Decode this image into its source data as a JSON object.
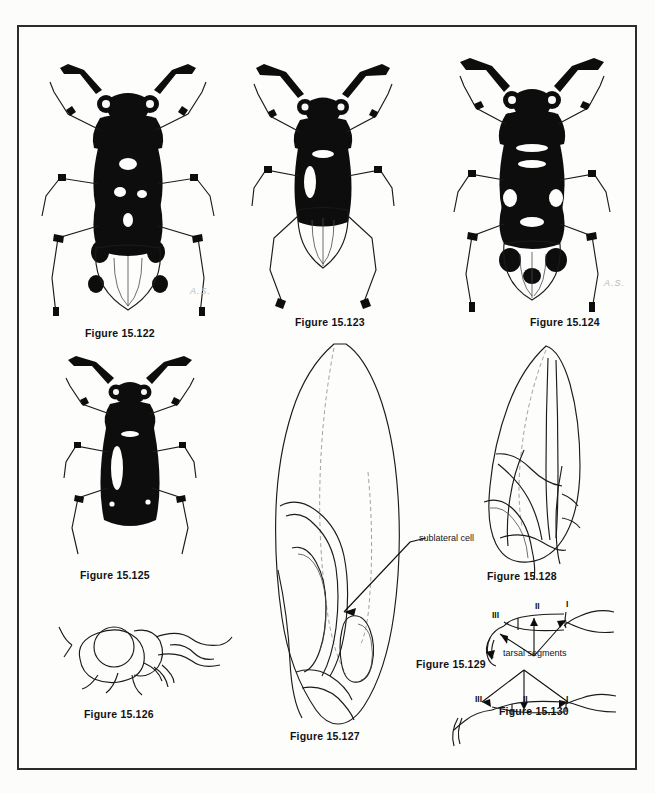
{
  "plate": {
    "kind": "scanned-figure-plate",
    "subject": "Heteroptera (true bugs) — habitus, hemelytra venation, head and tarsal segments",
    "border_color": "#2c2c2c",
    "background_color": "#fcfcfb",
    "ink_color": "#0d0d0d"
  },
  "figures": [
    {
      "id": "15.122",
      "caption": "Figure 15.122",
      "type": "bug-habitus-dorsal",
      "note": "pale bug with dark spots on hemelytra",
      "signature": "A.S."
    },
    {
      "id": "15.123",
      "caption": "Figure 15.123",
      "type": "bug-habitus-dorsal",
      "note": "dark bug with long antennae"
    },
    {
      "id": "15.124",
      "caption": "Figure 15.124",
      "type": "bug-habitus-dorsal",
      "note": "boldly black and white patterned bug",
      "signature": "A.S."
    },
    {
      "id": "15.125",
      "caption": "Figure 15.125",
      "type": "bug-habitus-dorsal",
      "note": "uniformly black bug"
    },
    {
      "id": "15.126",
      "caption": "Figure 15.126",
      "type": "head-lateral",
      "note": "lateral view of head with large eye"
    },
    {
      "id": "15.127",
      "caption": "Figure 15.127",
      "type": "hemelytron-venation",
      "note": "large hemelytron outline showing sublateral cell"
    },
    {
      "id": "15.128",
      "caption": "Figure 15.128",
      "type": "hemelytron-venation",
      "note": "smaller hemelytron with crossing veins"
    },
    {
      "id": "15.129",
      "caption": "Figure 15.129",
      "type": "tarsus-lateral",
      "note": "tarsal segments I, II, III"
    },
    {
      "id": "15.130",
      "caption": "Figure 15.130",
      "type": "tarsus-lateral",
      "note": "tarsal segments I, II, III"
    }
  ],
  "annotations": {
    "sublateral_cell": "sublateral cell",
    "tarsal_segments": "tarsal segments",
    "roman": {
      "one": "I",
      "two": "II",
      "three": "III"
    }
  },
  "signatures": {
    "artist_initials": "A.S."
  }
}
